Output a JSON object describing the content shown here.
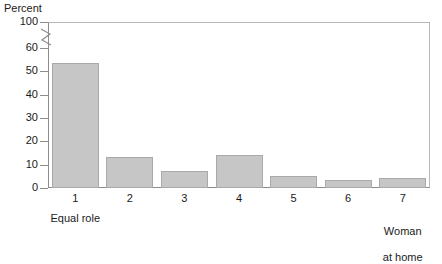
{
  "chart_data": {
    "type": "bar",
    "title": "",
    "subtitle": "",
    "xlabel": "",
    "ylabel": "Percent",
    "categories": [
      "1",
      "2",
      "3",
      "4",
      "5",
      "6",
      "7"
    ],
    "values": [
      53.5,
      13.5,
      7.3,
      14.0,
      5.2,
      3.6,
      4.2
    ],
    "series": [
      {
        "name": "Percent",
        "values": [
          53.5,
          13.5,
          7.3,
          14.0,
          5.2,
          3.6,
          4.2
        ]
      }
    ],
    "ylim": [
      0,
      100
    ],
    "ytick_labels": [
      "0",
      "10",
      "20",
      "30",
      "40",
      "50",
      "60",
      "100"
    ],
    "ytick_values": [
      0,
      10,
      20,
      30,
      40,
      50,
      60,
      100
    ],
    "axis_break": {
      "present": true,
      "between": [
        60,
        100
      ],
      "style": "zigzag"
    },
    "grid": false,
    "legend": null,
    "legend_position": "none",
    "annotations": [
      {
        "text": "Equal role",
        "anchor_category": "1"
      },
      {
        "text": "Woman\nat home",
        "anchor_category": "7"
      }
    ],
    "bar_fill_color": "#c6c6c6",
    "bar_border_color": "#a9a9a9",
    "axis_color": "#8d8d8d",
    "frame_color": "#b9b9b9",
    "text_color": "#1a1a1a"
  },
  "labels": {
    "y_axis_title": "Percent",
    "y_ticks": [
      "100",
      "60",
      "50",
      "40",
      "30",
      "20",
      "10",
      "0"
    ],
    "x_ticks": [
      "1",
      "2",
      "3",
      "4",
      "5",
      "6",
      "7"
    ],
    "note_left": "Equal role",
    "note_right_line1": "Woman",
    "note_right_line2": "at home"
  }
}
